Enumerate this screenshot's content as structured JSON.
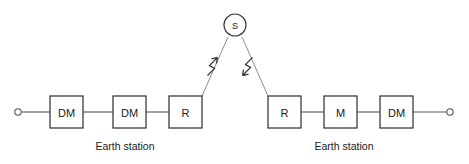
{
  "diagram": {
    "background_color": "#ffffff",
    "line_color": "#555555",
    "box_stroke_color": "#3c3c3c",
    "text_color": "#1a1a1a",
    "beam_color": "#8d8d8d",
    "satellite": {
      "label": "S",
      "cx": 235,
      "cy": 25,
      "r": 11
    },
    "left_station": {
      "caption": "Earth station",
      "caption_x": 125,
      "caption_y": 146,
      "terminal_label": "",
      "blocks": [
        {
          "label": "DM",
          "x": 50,
          "y": 96,
          "w": 33,
          "h": 32
        },
        {
          "label": "DM",
          "x": 113,
          "y": 96,
          "w": 33,
          "h": 32
        },
        {
          "label": "R",
          "x": 169,
          "y": 96,
          "w": 33,
          "h": 32
        }
      ]
    },
    "right_station": {
      "caption": "Earth station",
      "caption_x": 344,
      "caption_y": 146,
      "terminal_label": "",
      "blocks": [
        {
          "label": "R",
          "x": 268,
          "y": 96,
          "w": 33,
          "h": 32
        },
        {
          "label": "M",
          "x": 324,
          "y": 96,
          "w": 33,
          "h": 32
        },
        {
          "label": "DM",
          "x": 380,
          "y": 96,
          "w": 33,
          "h": 32
        }
      ]
    },
    "terminals": [
      {
        "name": "left-terminal",
        "cx": 18,
        "cy": 112,
        "r": 3.2
      },
      {
        "name": "right-terminal",
        "cx": 450,
        "cy": 112,
        "r": 3.2
      }
    ],
    "links": {
      "uplink": {
        "name": "uplink-beam",
        "from": {
          "x": 202,
          "y": 96
        },
        "to": {
          "x": 228,
          "y": 37
        },
        "direction": "up-toward-satellite"
      },
      "downlink": {
        "name": "downlink-beam",
        "from": {
          "x": 242,
          "y": 37
        },
        "to": {
          "x": 268,
          "y": 96
        },
        "direction": "down-toward-earth-station"
      }
    }
  }
}
